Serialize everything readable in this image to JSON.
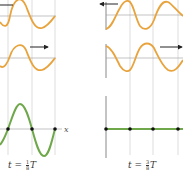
{
  "colors": {
    "incident_wave": "#E8A33C",
    "resultant_wave": "#6FA84A",
    "gridline": "#E3E3E3",
    "axis": "#8A8A8A",
    "arrow": "#222222",
    "node": "#111111"
  },
  "panels": [
    {
      "id": "left",
      "label": {
        "prefix": "t = ",
        "num": "1",
        "den": "8",
        "suffix": "T"
      },
      "axis_label": "x",
      "waves": [
        "leftward-moving wave",
        "rightward-moving wave",
        "resultant standing wave"
      ],
      "arrow_directions": [
        "left",
        "right"
      ]
    },
    {
      "id": "right",
      "label": {
        "prefix": "t = ",
        "num": "3",
        "den": "8",
        "suffix": "T"
      },
      "waves": [
        "leftward-moving wave",
        "rightward-moving wave",
        "resultant (flat) wave"
      ],
      "arrow_directions": [
        "left",
        "right"
      ]
    }
  ]
}
